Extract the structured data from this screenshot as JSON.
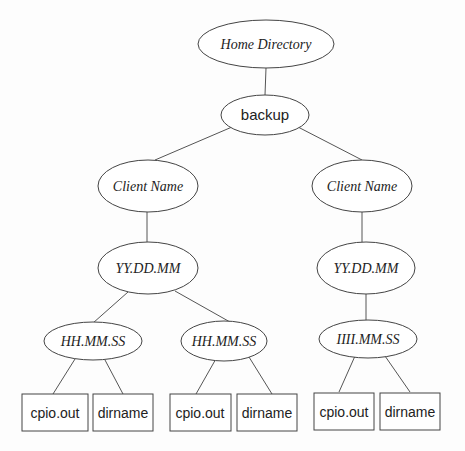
{
  "diagram": {
    "type": "directory-tree",
    "nodes": {
      "home": {
        "label": "Home Directory",
        "shape": "ellipse"
      },
      "backup": {
        "label": "backup",
        "shape": "ellipse"
      },
      "client_left": {
        "label": "Client Name",
        "shape": "ellipse"
      },
      "client_right": {
        "label": "Client Name",
        "shape": "ellipse"
      },
      "date_left": {
        "label": "YY.DD.MM",
        "shape": "ellipse"
      },
      "date_right": {
        "label": "YY.DD.MM",
        "shape": "ellipse"
      },
      "time_left": {
        "label": "HH.MM.SS",
        "shape": "ellipse"
      },
      "time_mid": {
        "label": "HH.MM.SS",
        "shape": "ellipse"
      },
      "time_right": {
        "label": "IIII.MM.SS",
        "shape": "ellipse"
      },
      "file_1": {
        "label": "cpio.out",
        "shape": "box"
      },
      "file_2": {
        "label": "dirname",
        "shape": "box"
      },
      "file_3": {
        "label": "cpio.out",
        "shape": "box"
      },
      "file_4": {
        "label": "dirname",
        "shape": "box"
      },
      "file_5": {
        "label": "cpio.out",
        "shape": "box"
      },
      "file_6": {
        "label": "dirname",
        "shape": "box"
      }
    },
    "edges": [
      [
        "home",
        "backup"
      ],
      [
        "backup",
        "client_left"
      ],
      [
        "backup",
        "client_right"
      ],
      [
        "client_left",
        "date_left"
      ],
      [
        "client_right",
        "date_right"
      ],
      [
        "date_left",
        "time_left"
      ],
      [
        "date_left",
        "time_mid"
      ],
      [
        "date_right",
        "time_right"
      ],
      [
        "time_left",
        "file_1"
      ],
      [
        "time_left",
        "file_2"
      ],
      [
        "time_mid",
        "file_3"
      ],
      [
        "time_mid",
        "file_4"
      ],
      [
        "time_right",
        "file_5"
      ],
      [
        "time_right",
        "file_6"
      ]
    ]
  }
}
